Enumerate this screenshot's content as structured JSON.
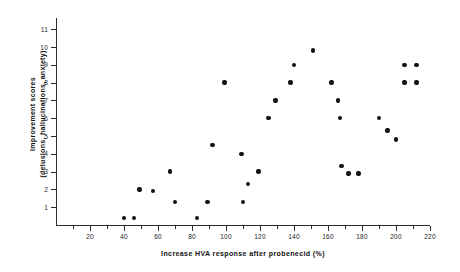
{
  "chart_data": {
    "type": "scatter",
    "title": "",
    "xlabel": "Increase  HVA  response  after  probenecid  (%)",
    "ylabel_line1": "Improvement  scores",
    "ylabel_line2": "(delusions, hallucinations, anxiety)",
    "xlim": [
      0,
      220
    ],
    "ylim": [
      0,
      11.6
    ],
    "xticks": [
      20,
      40,
      60,
      80,
      100,
      120,
      140,
      160,
      180,
      200,
      220
    ],
    "xticklabels": [
      "20",
      "40",
      "60",
      "80",
      "100",
      "120",
      "140",
      "160",
      "180",
      "200",
      "220"
    ],
    "xminorticks": [
      10,
      30,
      50,
      70,
      90,
      110,
      130,
      150,
      170,
      190,
      210
    ],
    "yticks": [
      1,
      2,
      3,
      4,
      5,
      6,
      7,
      8,
      9,
      10,
      11
    ],
    "yticklabels": [
      "1",
      "2",
      "3",
      "4",
      "5",
      "6",
      "7",
      "8",
      "9",
      "10",
      "11"
    ],
    "grid": false,
    "legend": false,
    "marker": "filled-circle",
    "marker_color": "#111111",
    "points": [
      {
        "x": 40,
        "y": 0.4
      },
      {
        "x": 46,
        "y": 0.4
      },
      {
        "x": 49,
        "y": 2.0
      },
      {
        "x": 57,
        "y": 1.9
      },
      {
        "x": 67,
        "y": 3.0
      },
      {
        "x": 70,
        "y": 1.3
      },
      {
        "x": 83,
        "y": 0.4
      },
      {
        "x": 89,
        "y": 1.3
      },
      {
        "x": 92,
        "y": 4.5
      },
      {
        "x": 99,
        "y": 8.0
      },
      {
        "x": 109,
        "y": 4.0
      },
      {
        "x": 110,
        "y": 1.3
      },
      {
        "x": 113,
        "y": 2.3
      },
      {
        "x": 119,
        "y": 3.0
      },
      {
        "x": 125,
        "y": 6.0
      },
      {
        "x": 129,
        "y": 7.0
      },
      {
        "x": 138,
        "y": 8.0
      },
      {
        "x": 140,
        "y": 9.0
      },
      {
        "x": 151,
        "y": 9.8
      },
      {
        "x": 162,
        "y": 8.0
      },
      {
        "x": 166,
        "y": 7.0
      },
      {
        "x": 167,
        "y": 6.0
      },
      {
        "x": 168,
        "y": 3.3
      },
      {
        "x": 172,
        "y": 2.9
      },
      {
        "x": 178,
        "y": 2.9
      },
      {
        "x": 190,
        "y": 6.0
      },
      {
        "x": 195,
        "y": 5.3
      },
      {
        "x": 200,
        "y": 4.8
      },
      {
        "x": 205,
        "y": 9.0
      },
      {
        "x": 212,
        "y": 9.0
      },
      {
        "x": 205,
        "y": 8.0
      },
      {
        "x": 212,
        "y": 8.0
      }
    ],
    "geometry": {
      "x_origin_px": 56,
      "x_scale_px_per_unit": 1.7,
      "y_zero_px": 225,
      "y_scale_px_per_unit": 17.8
    }
  }
}
